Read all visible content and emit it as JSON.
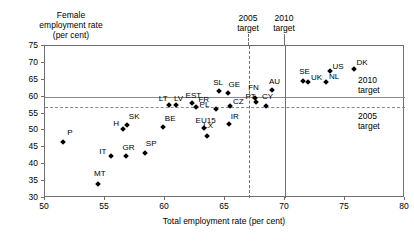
{
  "axis_titles": {
    "y_line1": "Female",
    "y_line2": "employment rate",
    "y_line3": "(per cent)",
    "x": "Total employment rate (per cent)"
  },
  "annotations": {
    "v2005_l1": "2005",
    "v2005_l2": "target",
    "v2010_l1": "2010",
    "v2010_l2": "target",
    "h2010_l1": "2010",
    "h2010_l2": "target",
    "h2005_l1": "2005",
    "h2005_l2": "target"
  },
  "chart_data": {
    "type": "scatter",
    "title": "",
    "xlabel": "Total employment rate (per cent)",
    "ylabel": "Female employment rate (per cent)",
    "xlim": [
      50,
      80
    ],
    "ylim": [
      30,
      75
    ],
    "xticks": [
      50,
      55,
      60,
      65,
      70,
      75,
      80
    ],
    "yticks": [
      30,
      35,
      40,
      45,
      50,
      55,
      60,
      65,
      70,
      75
    ],
    "grid": false,
    "legend": "none",
    "reference_lines": [
      {
        "orientation": "horizontal",
        "value": 60,
        "style": "solid",
        "label": "2010 target"
      },
      {
        "orientation": "horizontal",
        "value": 57,
        "style": "dashed",
        "label": "2005 target"
      },
      {
        "orientation": "vertical",
        "value": 67,
        "style": "dashed",
        "label": "2005 target"
      },
      {
        "orientation": "vertical",
        "value": 70,
        "style": "solid",
        "label": "2010 target"
      }
    ],
    "points": [
      {
        "label": "P",
        "x": 51.6,
        "y": 46.4,
        "lx": 4,
        "ly": -9
      },
      {
        "label": "MT",
        "x": 54.5,
        "y": 33.8,
        "lx": -4,
        "ly": -10
      },
      {
        "label": "IT",
        "x": 55.6,
        "y": 42.0,
        "lx": -12,
        "ly": -4
      },
      {
        "label": "H",
        "x": 56.6,
        "y": 50.2,
        "lx": -10,
        "ly": -5
      },
      {
        "label": "SK",
        "x": 56.9,
        "y": 51.4,
        "lx": 2,
        "ly": -8
      },
      {
        "label": "GR",
        "x": 56.8,
        "y": 42.2,
        "lx": -3,
        "ly": -8
      },
      {
        "label": "SP",
        "x": 58.4,
        "y": 43.0,
        "lx": 1,
        "ly": -9
      },
      {
        "label": "BE",
        "x": 59.9,
        "y": 50.8,
        "lx": 2,
        "ly": -8
      },
      {
        "label": "LT",
        "x": 60.4,
        "y": 57.2,
        "lx": -10,
        "ly": -6
      },
      {
        "label": "LV",
        "x": 61.0,
        "y": 57.1,
        "lx": -2,
        "ly": -6
      },
      {
        "label": "EST",
        "x": 62.3,
        "y": 57.8,
        "lx": -6,
        "ly": -7
      },
      {
        "label": "FR",
        "x": 62.7,
        "y": 56.7,
        "lx": 2,
        "ly": -7
      },
      {
        "label": "EU15",
        "x": 63.3,
        "y": 50.3,
        "lx": -8,
        "ly": -7
      },
      {
        "label": "LX",
        "x": 63.6,
        "y": 48.1,
        "lx": -4,
        "ly": -10
      },
      {
        "label": "PL",
        "x": 64.3,
        "y": 56.0,
        "lx": -16,
        "ly": -4
      },
      {
        "label": "SL",
        "x": 64.6,
        "y": 61.3,
        "lx": -6,
        "ly": -8
      },
      {
        "label": "GE",
        "x": 65.3,
        "y": 60.8,
        "lx": 1,
        "ly": -8
      },
      {
        "label": "IR",
        "x": 65.4,
        "y": 51.5,
        "lx": 2,
        "ly": -7
      },
      {
        "label": "CZ",
        "x": 65.5,
        "y": 56.9,
        "lx": 3,
        "ly": -4
      },
      {
        "label": "FN",
        "x": 67.6,
        "y": 59.4,
        "lx": -7,
        "ly": -10
      },
      {
        "label": "PT",
        "x": 67.7,
        "y": 58.2,
        "lx": -11,
        "ly": -5
      },
      {
        "label": "CY",
        "x": 68.5,
        "y": 56.8,
        "lx": -4,
        "ly": -9
      },
      {
        "label": "AU",
        "x": 69.0,
        "y": 61.6,
        "lx": -3,
        "ly": -8
      },
      {
        "label": "SE",
        "x": 71.6,
        "y": 64.3,
        "lx": -4,
        "ly": -9
      },
      {
        "label": "UK",
        "x": 72.0,
        "y": 63.9,
        "lx": 3,
        "ly": -4
      },
      {
        "label": "NL",
        "x": 73.5,
        "y": 64.0,
        "lx": 3,
        "ly": -5
      },
      {
        "label": "US",
        "x": 73.8,
        "y": 67.4,
        "lx": 3,
        "ly": -4
      },
      {
        "label": "DK",
        "x": 75.8,
        "y": 67.9,
        "lx": 3,
        "ly": -6
      }
    ]
  }
}
